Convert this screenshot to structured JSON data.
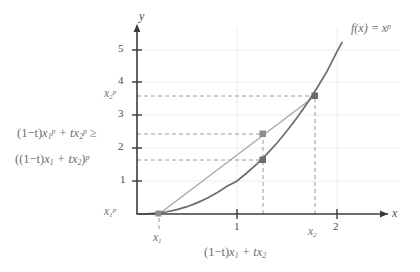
{
  "chart_data": {
    "type": "line",
    "title": "",
    "xlabel": "x",
    "ylabel": "y",
    "xlim": [
      -0.18,
      2.3
    ],
    "ylim": [
      -0.35,
      5.8
    ],
    "grid": true,
    "legend": false,
    "function_label": "f(x) = x",
    "function_label_exponent": "p",
    "exponent_p": 2.3,
    "x_ticks": [
      1,
      2
    ],
    "x_tick_labels": [
      "1",
      "2"
    ],
    "y_ticks": [
      1,
      2,
      3,
      4,
      5
    ],
    "y_tick_labels": [
      "1",
      "2",
      "3",
      "4",
      "5"
    ],
    "series": [
      {
        "name": "f(x) = x^p",
        "type": "curve",
        "color": "#6b6b70",
        "x": [
          0,
          0.1,
          0.2,
          0.3,
          0.4,
          0.5,
          0.6,
          0.7,
          0.8,
          0.9,
          1.0,
          1.1,
          1.2,
          1.3,
          1.4,
          1.5,
          1.6,
          1.7,
          1.8,
          1.9,
          2.0,
          2.05
        ],
        "y": [
          0,
          0.005,
          0.026,
          0.068,
          0.133,
          0.222,
          0.337,
          0.478,
          0.645,
          0.839,
          1.0,
          1.25,
          1.52,
          1.82,
          2.15,
          2.52,
          2.92,
          3.35,
          3.82,
          4.32,
          4.92,
          5.2
        ]
      },
      {
        "name": "chord",
        "type": "segment",
        "color": "#a8a8ad",
        "x": [
          0.22,
          1.72
        ],
        "y": [
          0.03,
          3.63
        ]
      }
    ],
    "points": [
      {
        "name": "left-endpoint",
        "x": 0.22,
        "y": 0.03,
        "color": "#8c8c92"
      },
      {
        "name": "chord-point",
        "x": 1.27,
        "y": 2.45,
        "color": "#8c8c92"
      },
      {
        "name": "curve-point",
        "x": 1.27,
        "y": 1.67,
        "color": "#6b6b70"
      },
      {
        "name": "right-endpoint",
        "x": 1.72,
        "y": 3.63,
        "color": "#6b6b70"
      }
    ],
    "annotations": {
      "y_axis_label_top": "x",
      "y_axis_label_top_sub": "2",
      "y_axis_label_top_sup": "p",
      "y_axis_label_bottom": "x",
      "y_axis_label_bottom_sub": "1",
      "y_axis_label_bottom_sup": "p",
      "chord_value_label": "(1−t)x + tx  ≥",
      "curve_value_label": "((1−t)x + tx )",
      "x_axis_point_left": "x",
      "x_axis_point_left_sub": "1",
      "x_axis_point_right": "x",
      "x_axis_point_right_sub": "2",
      "x_axis_midpoint_label": "(1−t)x + tx"
    },
    "dashed_guides": [
      {
        "name": "x2p-horizontal",
        "from": [
          0,
          3.63
        ],
        "to": [
          1.72,
          3.63
        ]
      },
      {
        "name": "chord-horizontal",
        "from": [
          0,
          2.45
        ],
        "to": [
          1.27,
          2.45
        ]
      },
      {
        "name": "curve-horizontal",
        "from": [
          0,
          1.67
        ],
        "to": [
          1.27,
          1.67
        ]
      },
      {
        "name": "x1p-horizontal",
        "from": [
          0,
          0.03
        ],
        "to": [
          0.22,
          0.03
        ]
      },
      {
        "name": "midpoint-vertical",
        "from": [
          1.27,
          0
        ],
        "to": [
          1.27,
          2.45
        ]
      },
      {
        "name": "x2-vertical",
        "from": [
          1.72,
          0
        ],
        "to": [
          1.72,
          3.63
        ]
      },
      {
        "name": "x1-vertical",
        "from": [
          0.22,
          0
        ],
        "to": [
          0.22,
          0.03
        ]
      }
    ],
    "colors": {
      "curve": "#6b6b70",
      "chord": "#a8a8ad",
      "axis": "#3c3c40",
      "dashed": "#9a9aa0",
      "grid": "#ededf0",
      "text": "#6e6e72",
      "tick_text": "#4a4a4e"
    }
  },
  "labels": {
    "y_axis": "y",
    "x_axis": "x",
    "function": "f(x) = x",
    "function_sup": "p",
    "y_tick_1": "1",
    "y_tick_2": "2",
    "y_tick_3": "3",
    "y_tick_4": "4",
    "y_tick_5": "5",
    "x_tick_1": "1",
    "x_tick_2": "2",
    "x2p_base": "x",
    "x2p_sub": "2",
    "x2p_sup": "p",
    "x1p_base": "x",
    "x1p_sub": "1",
    "x1p_sup": "p",
    "x1_base": "x",
    "x1_sub": "1",
    "x2_base": "x",
    "x2_sub": "2",
    "ineq_open": "(1−t)",
    "ineq_x1": "x",
    "ineq_x1_sub": "1",
    "ineq_x1_sup": "p",
    "ineq_plus": " + t",
    "ineq_x2": "x",
    "ineq_x2_sub": "2",
    "ineq_x2_sup": "p",
    "ineq_sign": " ≥",
    "conv_open": "((1−t)",
    "conv_x1": "x",
    "conv_x1_sub": "1",
    "conv_plus": " + t",
    "conv_x2": "x",
    "conv_x2_sub": "2",
    "conv_close": ")",
    "conv_sup": "p",
    "mid_open": "(1−t)",
    "mid_x1": "x",
    "mid_x1_sub": "1",
    "mid_plus": " + t",
    "mid_x2": "x",
    "mid_x2_sub": "2"
  }
}
